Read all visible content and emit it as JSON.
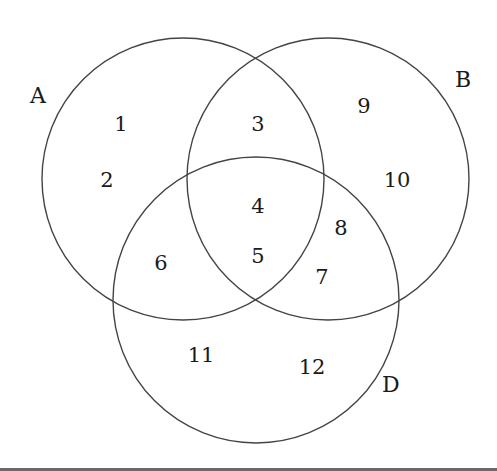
{
  "diagram": {
    "type": "venn-3-set",
    "sets": [
      {
        "label": "A",
        "cx": 183,
        "cy": 179,
        "r": 141,
        "label_x": 30,
        "label_y": 103
      },
      {
        "label": "B",
        "cx": 328,
        "cy": 179,
        "r": 141,
        "label_x": 455,
        "label_y": 87
      },
      {
        "label": "D",
        "cx": 256,
        "cy": 300,
        "r": 143,
        "label_x": 382,
        "label_y": 392
      }
    ],
    "regions": [
      {
        "value": "1",
        "sets": "A only",
        "x": 121,
        "y": 131
      },
      {
        "value": "2",
        "sets": "A only",
        "x": 107,
        "y": 187
      },
      {
        "value": "3",
        "sets": "A and B only",
        "x": 258,
        "y": 131
      },
      {
        "value": "4",
        "sets": "A, B and D",
        "x": 258,
        "y": 213
      },
      {
        "value": "5",
        "sets": "A, B and D",
        "x": 258,
        "y": 263
      },
      {
        "value": "6",
        "sets": "A and D only",
        "x": 161,
        "y": 270
      },
      {
        "value": "7",
        "sets": "B and D only",
        "x": 322,
        "y": 284
      },
      {
        "value": "8",
        "sets": "B and D only",
        "x": 341,
        "y": 235
      },
      {
        "value": "9",
        "sets": "B only",
        "x": 364,
        "y": 113
      },
      {
        "value": "10",
        "sets": "B only",
        "x": 397,
        "y": 187
      },
      {
        "value": "11",
        "sets": "D only",
        "x": 201,
        "y": 362
      },
      {
        "value": "12",
        "sets": "D only",
        "x": 312,
        "y": 374
      }
    ],
    "stroke_color": "#444444",
    "text_color": "#1a1a1a",
    "background": "#ffffff"
  }
}
